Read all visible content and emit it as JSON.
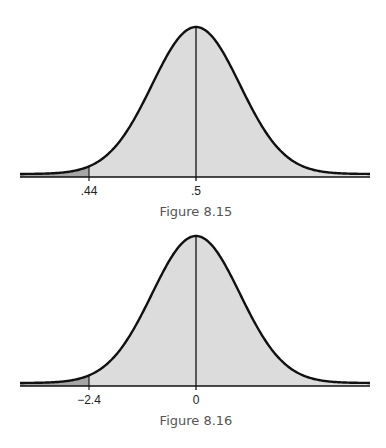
{
  "colors": {
    "curve": "#111111",
    "fill": "#dcdcdc",
    "tail_fill": "#a6a6a6",
    "axis": "#111111",
    "caption": "#555555"
  },
  "chart_data": [
    {
      "type": "area",
      "title": "Figure 8.15",
      "description": "Normal distribution curve with shaded left tail below .44",
      "center_label": ".5",
      "cutoff_label": ".44",
      "tick_labels": [
        ".44",
        ".5"
      ],
      "shaded_region": "left tail x < .44",
      "grid": false,
      "legend": null,
      "layout": {
        "left": 20,
        "right": 370,
        "center_x": 196,
        "baseline_y": 177,
        "peak_y": 27,
        "sigma_px": 44,
        "cutoff_x": 89
      }
    },
    {
      "type": "area",
      "title": "Figure 8.16",
      "description": "Standard normal curve with shaded left tail below z = -2.4",
      "center_label": "0",
      "cutoff_label": "−2.4",
      "tick_labels": [
        "−2.4",
        "0"
      ],
      "shaded_region": "left tail z < -2.4",
      "grid": false,
      "legend": null,
      "layout": {
        "left": 20,
        "right": 370,
        "center_x": 196,
        "baseline_y": 162,
        "peak_y": 12,
        "sigma_px": 44,
        "cutoff_x": 89
      }
    }
  ]
}
